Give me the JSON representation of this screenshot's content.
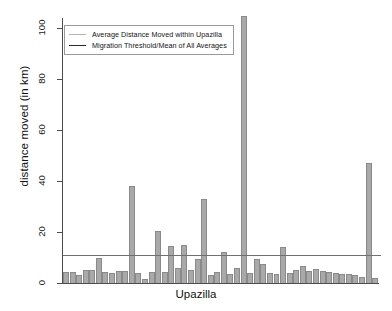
{
  "chart_data": {
    "type": "bar",
    "title": "",
    "xlabel": "Upazilla",
    "ylabel": "distance moved (in km)",
    "ylim": [
      0,
      108
    ],
    "yticks": [
      0,
      20,
      40,
      60,
      80,
      100
    ],
    "ytick_labels": [
      "0",
      "20",
      "40",
      "60",
      "80",
      "100"
    ],
    "grid": false,
    "legend_position": "top-left",
    "legend": [
      {
        "label": "Average Distance Moved within Upazilla",
        "marker": "line",
        "color": "#b4b4b4"
      },
      {
        "label": "Migration Threshold/Mean of All Averages",
        "marker": "line",
        "color": "#2b2b2b"
      }
    ],
    "series": [
      {
        "name": "Average Distance Moved within Upazilla",
        "color": "#a9a9a9",
        "values": [
          4.5,
          4.2,
          3.0,
          5.2,
          5.0,
          9.8,
          4.5,
          4.0,
          4.6,
          4.8,
          38.0,
          3.8,
          1.6,
          4.2,
          20.5,
          4.2,
          14.5,
          6.0,
          15.0,
          5.2,
          9.5,
          33.0,
          3.2,
          4.2,
          12.0,
          3.6,
          6.0,
          105.0,
          4.0,
          9.4,
          7.5,
          4.0,
          3.4,
          14.0,
          3.8,
          5.2,
          6.5,
          4.6,
          5.4,
          4.6,
          4.2,
          4.0,
          3.6,
          3.4,
          3.0,
          2.4,
          47.0,
          2.0
        ]
      }
    ],
    "threshold": {
      "name": "Migration Threshold/Mean of All Averages",
      "value": 11.0,
      "color": "#707070"
    }
  }
}
